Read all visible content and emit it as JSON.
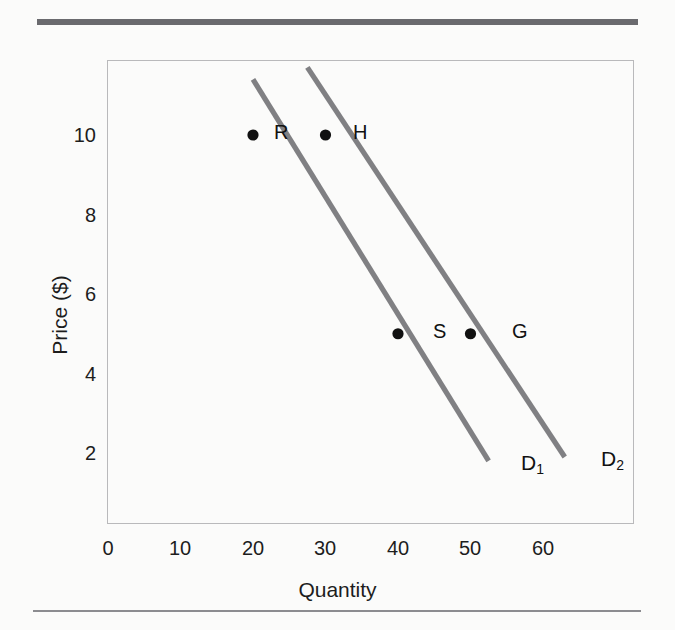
{
  "chart_data": {
    "type": "line",
    "title": "",
    "xlabel": "Quantity",
    "ylabel": "Price ($)",
    "xlim": [
      0,
      66
    ],
    "ylim": [
      0,
      12
    ],
    "xticks": [
      "0",
      "10",
      "20",
      "30",
      "40",
      "50",
      "60"
    ],
    "xtick_values": [
      0,
      10,
      20,
      30,
      40,
      50,
      60
    ],
    "yticks": [
      "10",
      "8",
      "6",
      "4",
      "2"
    ],
    "ytick_values": [
      10,
      8,
      6,
      4,
      2
    ],
    "grid": false,
    "legend": "none",
    "line_color": "#808083",
    "point_color": "#111111",
    "frame_color": "#b9b9bb",
    "series": [
      {
        "name": "D1",
        "label": "D",
        "subscript": "1",
        "x": [
          20.0,
          52.5
        ],
        "y": [
          11.4,
          1.8
        ],
        "points": [
          {
            "label": "R",
            "x": 20,
            "y": 10
          },
          {
            "label": "S",
            "x": 40,
            "y": 5
          }
        ]
      },
      {
        "name": "D2",
        "label": "D",
        "subscript": "2",
        "x": [
          27.5,
          63.0
        ],
        "y": [
          11.7,
          1.9
        ],
        "points": [
          {
            "label": "H",
            "x": 30,
            "y": 10
          },
          {
            "label": "G",
            "x": 50,
            "y": 5
          }
        ]
      }
    ]
  }
}
